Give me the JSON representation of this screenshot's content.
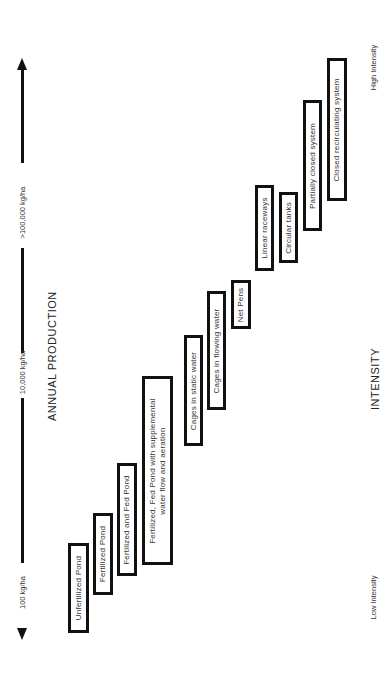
{
  "production_axis": {
    "title": "ANNUAL PRODUCTION",
    "ticks": [
      "100 kg/ha",
      "10,000 kg/ha",
      ">100,000 kg/ha"
    ]
  },
  "intensity_axis": {
    "title": "INTENSITY",
    "low_label": "Low Intensity",
    "high_label": "High Intensity"
  },
  "systems": [
    {
      "label": "Unfertilized Pond"
    },
    {
      "label": "Fertilized Pond"
    },
    {
      "label": "Fertilized and Fed Pond"
    },
    {
      "label_line1": "Fertilized, Fed Pond with supplemental",
      "label_line2": "water flow and aeration"
    },
    {
      "label": "Cages in static water"
    },
    {
      "label": "Cages in flowing water"
    },
    {
      "label": "Net Pens"
    },
    {
      "label": "Linear raceways"
    },
    {
      "label": "Circular tanks"
    },
    {
      "label": "Partially closed system"
    },
    {
      "label": "Closed recirculating system"
    }
  ]
}
